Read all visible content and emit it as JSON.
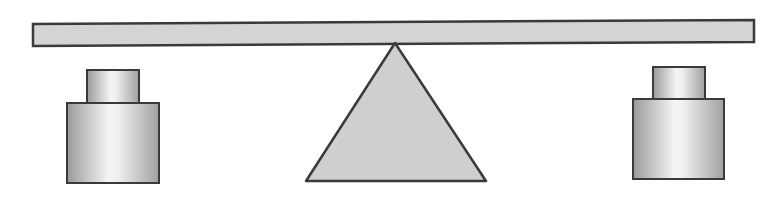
{
  "diagram": {
    "type": "balance-scale",
    "colors": {
      "background": "#ffffff",
      "stroke": "#3a3a3a",
      "beam_fill": "#d4d4d4",
      "fulcrum_fill": "#cfcfcf",
      "weight_dark": "#9a9a9a",
      "weight_light": "#f4f4f4"
    },
    "beam": {
      "x1": 33,
      "y1_top": 24,
      "x2": 754,
      "y2_top": 20,
      "thickness": 22
    },
    "fulcrum": {
      "apex": [
        395,
        43
      ],
      "base_left": [
        306,
        181
      ],
      "base_right": [
        486,
        181
      ]
    },
    "weights": [
      {
        "side": "left",
        "cap": {
          "x": 87,
          "y": 70,
          "w": 52,
          "h": 33
        },
        "body": {
          "x": 67,
          "y": 103,
          "w": 92,
          "h": 80
        }
      },
      {
        "side": "right",
        "cap": {
          "x": 653,
          "y": 67,
          "w": 52,
          "h": 32
        },
        "body": {
          "x": 633,
          "y": 99,
          "w": 91,
          "h": 80
        }
      }
    ]
  }
}
